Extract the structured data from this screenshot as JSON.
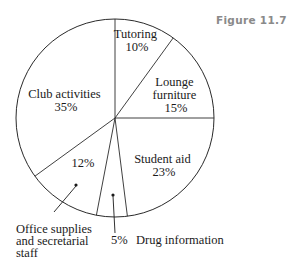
{
  "figure_label": "Figure 11.7",
  "chart_data": {
    "type": "pie",
    "title": "",
    "start_angle_deg": 0,
    "direction": "clockwise",
    "slices": [
      {
        "label": "Tutoring",
        "value": 10,
        "display": "10%"
      },
      {
        "label": "Lounge furniture",
        "value": 15,
        "display": "15%"
      },
      {
        "label": "Student aid",
        "value": 23,
        "display": "23%"
      },
      {
        "label": "Drug information",
        "value": 5,
        "display": "5%"
      },
      {
        "label": "Office supplies and secretarial staff",
        "value": 12,
        "display": "12%"
      },
      {
        "label": "Club activities",
        "value": 35,
        "display": "35%"
      }
    ],
    "categories": [
      "Tutoring",
      "Lounge furniture",
      "Student aid",
      "Drug information",
      "Office supplies and secretarial staff",
      "Club activities"
    ],
    "values": [
      10,
      15,
      23,
      5,
      12,
      35
    ]
  },
  "labels": {
    "tutoring": [
      "Tutoring",
      "10%"
    ],
    "lounge": [
      "Lounge",
      "furniture",
      "15%"
    ],
    "student_aid": [
      "Student aid",
      "23%"
    ],
    "club": [
      "Club activities",
      "35%"
    ],
    "office_pct": "12%",
    "office_callout": [
      "Office supplies",
      "and secretarial",
      "staff"
    ],
    "drug_pct": "5%",
    "drug_callout": "Drug information"
  }
}
